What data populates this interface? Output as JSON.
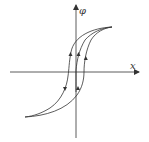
{
  "diagram": {
    "type": "hysteresis-loop",
    "axes": {
      "x_label": "x",
      "y_label": "φ"
    },
    "colors": {
      "line": "#333333",
      "background": "#ffffff"
    },
    "curves": [
      {
        "name": "outer-loop-upper-branch",
        "direction": "descending"
      },
      {
        "name": "outer-loop-lower-branch",
        "direction": "ascending"
      },
      {
        "name": "inner-branch",
        "direction": "ascending"
      }
    ]
  }
}
